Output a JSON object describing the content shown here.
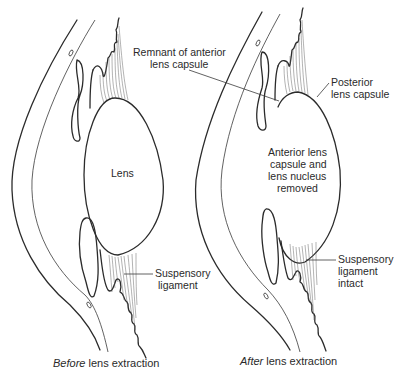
{
  "diagram": {
    "panels": [
      {
        "id": "before",
        "caption_italic": "Before",
        "caption_rest": " lens extraction",
        "labels": {
          "lens": "Lens",
          "suspensory_line1": "Suspensory",
          "suspensory_line2": "ligament"
        }
      },
      {
        "id": "after",
        "caption_italic": "After",
        "caption_rest": " lens extraction",
        "labels": {
          "remnant_line1": "Remnant of anterior",
          "remnant_line2": "lens capsule",
          "posterior_line1": "Posterior",
          "posterior_line2": "lens capsule",
          "removed_line1": "Anterior lens",
          "removed_line2": "capsule and",
          "removed_line3": "lens nucleus",
          "removed_line4": "removed",
          "suspensory_line1": "Suspensory",
          "suspensory_line2": "ligament",
          "suspensory_line3": "intact"
        }
      }
    ]
  }
}
